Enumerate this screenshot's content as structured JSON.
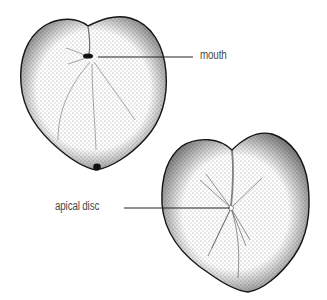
{
  "figure": {
    "views": [
      {
        "id": "oral-view",
        "labels": [
          {
            "text": "mouth",
            "target": [
              88,
              57
            ],
            "line_start": [
              98,
              57
            ],
            "line_end": [
              193,
              57
            ]
          }
        ]
      },
      {
        "id": "aboral-view",
        "labels": [
          {
            "text": "apical disc",
            "target": [
              231,
              208
            ],
            "line_start": [
              124,
              208
            ],
            "line_end": [
              230,
              208
            ]
          }
        ]
      }
    ]
  },
  "colors": {
    "background": "#ffffff",
    "outline": "#1a1a1a",
    "stipple": "#2a2a2a",
    "label_text": "#4a4a4a",
    "leader_line": "#222222"
  }
}
